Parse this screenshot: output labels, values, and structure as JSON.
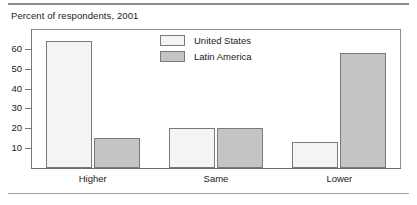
{
  "chart_data": {
    "type": "bar",
    "title": "Percent of respondents, 2001",
    "xlabel": "",
    "ylabel": "",
    "ylim": [
      0,
      70
    ],
    "yticks": [
      10,
      20,
      30,
      40,
      50,
      60
    ],
    "grid": false,
    "legend_position": "inside-top-center",
    "categories": [
      "Higher",
      "Same",
      "Lower"
    ],
    "series": [
      {
        "name": "United States",
        "color": "#f4f4f2",
        "values": [
          64,
          20,
          13
        ]
      },
      {
        "name": "Latin America",
        "color": "#c4c4c4",
        "values": [
          15,
          20,
          58
        ]
      }
    ]
  },
  "axis": {
    "tick_labels": [
      "60",
      "50",
      "40",
      "30",
      "20",
      "10"
    ],
    "category_labels": [
      "Higher",
      "Same",
      "Lower"
    ]
  },
  "legend": {
    "entries": [
      {
        "label": "United States"
      },
      {
        "label": "Latin America"
      }
    ]
  }
}
